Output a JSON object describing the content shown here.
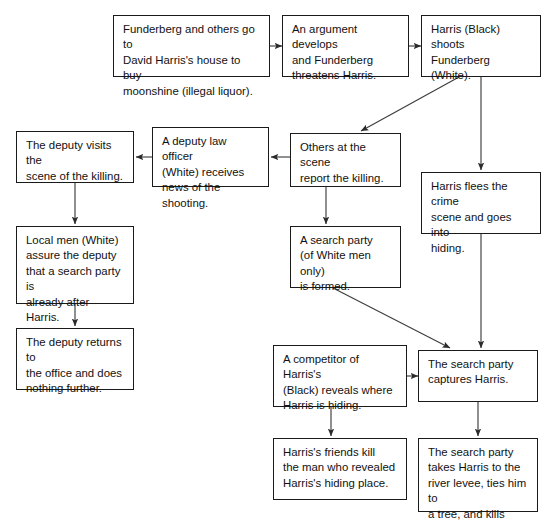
{
  "diagram": {
    "background_color": "#ffffff",
    "box_border_color": "#1a1a1a",
    "text_color": "#111111",
    "edge_color": "#3d3d3d",
    "nodes": [
      {
        "id": "n1",
        "name": "buy-moonshine",
        "text": "Funderberg and others go to\nDavid Harris's house to buy\nmoonshine (illegal liquor).",
        "x": 113,
        "y": 15,
        "w": 157,
        "h": 62
      },
      {
        "id": "n2",
        "name": "argument-develops",
        "text": "An argument develops\nand Funderberg\nthreatens Harris.",
        "x": 282,
        "y": 15,
        "w": 127,
        "h": 62
      },
      {
        "id": "n3",
        "name": "harris-shoots-funderberg",
        "text": "Harris (Black) shoots\nFunderberg (White).",
        "x": 421,
        "y": 15,
        "w": 120,
        "h": 62
      },
      {
        "id": "n4",
        "name": "deputy-visits-scene",
        "text": "The deputy visits the\nscene of the killing.",
        "x": 16,
        "y": 131,
        "w": 118,
        "h": 52
      },
      {
        "id": "n5",
        "name": "deputy-receives-news",
        "text": "A deputy law officer\n(White) receives\nnews of the shooting.",
        "x": 152,
        "y": 127,
        "w": 117,
        "h": 60
      },
      {
        "id": "n6",
        "name": "others-report-killing",
        "text": "Others at the scene\nreport the killing.",
        "x": 290,
        "y": 133,
        "w": 111,
        "h": 54
      },
      {
        "id": "n7",
        "name": "harris-flees",
        "text": "Harris flees the crime\nscene and goes into\nhiding.",
        "x": 421,
        "y": 172,
        "w": 120,
        "h": 62
      },
      {
        "id": "n8",
        "name": "local-men-assure-deputy",
        "text": "Local men (White)\nassure the deputy\nthat a search party is\nalready after Harris.",
        "x": 16,
        "y": 226,
        "w": 118,
        "h": 78
      },
      {
        "id": "n9",
        "name": "search-party-formed",
        "text": "A search party\n(of White men only)\nis formed.",
        "x": 290,
        "y": 226,
        "w": 111,
        "h": 62
      },
      {
        "id": "n10",
        "name": "deputy-returns-office",
        "text": "The deputy returns to\nthe office and does\nnothing further.",
        "x": 16,
        "y": 328,
        "w": 118,
        "h": 62
      },
      {
        "id": "n11",
        "name": "competitor-reveals-location",
        "text": "A competitor of Harris's\n(Black) reveals where\nHarris is hiding.",
        "x": 273,
        "y": 345,
        "w": 134,
        "h": 62
      },
      {
        "id": "n12",
        "name": "search-party-captures-harris",
        "text": "The search party\ncaptures Harris.",
        "x": 418,
        "y": 350,
        "w": 120,
        "h": 52
      },
      {
        "id": "n13",
        "name": "friends-kill-informer",
        "text": "Harris's friends kill\nthe man who revealed\nHarris's hiding place.",
        "x": 273,
        "y": 438,
        "w": 134,
        "h": 62
      },
      {
        "id": "n14",
        "name": "harris-killed-at-levee",
        "text": "The search party\ntakes Harris to the\nriver levee, ties him to\na tree, and kills him.",
        "x": 418,
        "y": 438,
        "w": 120,
        "h": 74
      }
    ],
    "edges": [
      {
        "name": "edge-buy-moonshine-to-argument",
        "from": "n1",
        "to": "n2",
        "points": "270,46 282,46"
      },
      {
        "name": "edge-argument-to-shooting",
        "from": "n2",
        "to": "n3",
        "points": "409,46 421,46"
      },
      {
        "name": "edge-shooting-to-others-report",
        "from": "n3",
        "to": "n6",
        "points": "459,77 361,131"
      },
      {
        "name": "edge-shooting-to-harris-flees",
        "from": "n3",
        "to": "n7",
        "points": "481,77 481,170"
      },
      {
        "name": "edge-others-report-to-deputy-news",
        "from": "n6",
        "to": "n5",
        "points": "290,157 271,157"
      },
      {
        "name": "edge-deputy-news-to-deputy-visits",
        "from": "n5",
        "to": "n4",
        "points": "152,157 136,157"
      },
      {
        "name": "edge-deputy-visits-to-local-men",
        "from": "n4",
        "to": "n8",
        "points": "75,183 75,224"
      },
      {
        "name": "edge-others-report-to-search-party",
        "from": "n6",
        "to": "n9",
        "points": "326,187 326,224"
      },
      {
        "name": "edge-local-men-to-deputy-returns",
        "from": "n8",
        "to": "n10",
        "points": "75,304 75,326"
      },
      {
        "name": "edge-search-party-to-capture",
        "from": "n9",
        "to": "n12",
        "points": "333,288 450,348"
      },
      {
        "name": "edge-harris-flees-to-capture",
        "from": "n7",
        "to": "n12",
        "points": "481,234 481,348"
      },
      {
        "name": "edge-competitor-to-capture",
        "from": "n11",
        "to": "n12",
        "points": "407,376 418,376"
      },
      {
        "name": "edge-competitor-to-friends-kill",
        "from": "n11",
        "to": "n13",
        "points": "331,407 331,436"
      },
      {
        "name": "edge-capture-to-levee",
        "from": "n12",
        "to": "n14",
        "points": "478,402 478,436"
      }
    ]
  }
}
